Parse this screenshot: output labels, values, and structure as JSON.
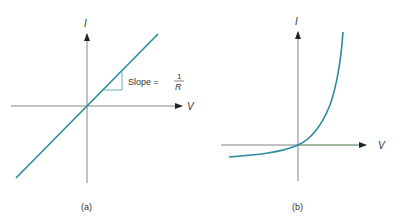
{
  "panels": [
    {
      "id": "a",
      "caption": "(a)",
      "x_axis_label": "V",
      "y_axis_label": "I",
      "curve": "linear",
      "annotation": {
        "text": "Slope =",
        "fraction_num": "1",
        "fraction_den": "R"
      }
    },
    {
      "id": "b",
      "caption": "(b)",
      "x_axis_label": "V",
      "y_axis_label": "I",
      "curve": "exponential"
    }
  ],
  "colors": {
    "curve": "#2a8a9e",
    "axis": "#555555",
    "text": "#333333"
  }
}
